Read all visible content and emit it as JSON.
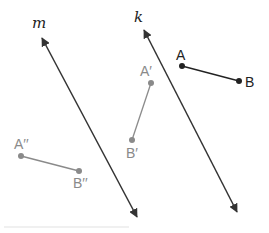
{
  "diagram": {
    "type": "geometry-reflection",
    "colors": {
      "line": "#333333",
      "original": "#222222",
      "image1": "#8a8a8a",
      "image2": "#8a8a8a"
    },
    "lines": [
      {
        "name": "m",
        "label": "m",
        "x1": 42,
        "y1": 38,
        "x2": 137,
        "y2": 217,
        "label_x": 32,
        "label_y": 28
      },
      {
        "name": "k",
        "label": "k",
        "x1": 144,
        "y1": 30,
        "x2": 237,
        "y2": 212,
        "label_x": 134,
        "label_y": 22
      }
    ],
    "segments": [
      {
        "name": "AB",
        "role": "original",
        "p1": {
          "label": "A",
          "x": 182,
          "y": 66,
          "lx": 176,
          "ly": 60
        },
        "p2": {
          "label": "B",
          "x": 239,
          "y": 81,
          "lx": 245,
          "ly": 87
        }
      },
      {
        "name": "A'B'",
        "role": "image1",
        "p1": {
          "label": "A′",
          "x": 151,
          "y": 83,
          "lx": 140,
          "ly": 76
        },
        "p2": {
          "label": "B′",
          "x": 132,
          "y": 140,
          "lx": 126,
          "ly": 158
        }
      },
      {
        "name": "A''B''",
        "role": "image2",
        "p1": {
          "label": "A′′",
          "x": 21,
          "y": 156,
          "lx": 14,
          "ly": 149
        },
        "p2": {
          "label": "B′′",
          "x": 79,
          "y": 171,
          "lx": 73,
          "ly": 188
        }
      }
    ]
  }
}
